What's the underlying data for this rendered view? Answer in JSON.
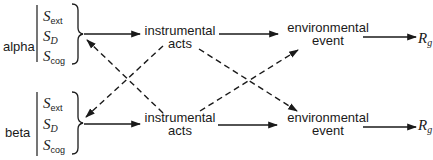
{
  "groups": [
    {
      "label": "alpha",
      "stimuli": [
        {
          "symbol": "S",
          "subscript": "ext",
          "subscript_italic": false
        },
        {
          "symbol": "S",
          "subscript": "D",
          "subscript_italic": true
        },
        {
          "symbol": "S",
          "subscript": "cog",
          "subscript_italic": false
        }
      ],
      "act": [
        "instrumental",
        "acts"
      ],
      "event": [
        "environmental",
        "event"
      ],
      "response": {
        "symbol": "R",
        "subscript": "g"
      }
    },
    {
      "label": "beta",
      "stimuli": [
        {
          "symbol": "S",
          "subscript": "ext",
          "subscript_italic": false
        },
        {
          "symbol": "S",
          "subscript": "D",
          "subscript_italic": true
        },
        {
          "symbol": "S",
          "subscript": "cog",
          "subscript_italic": false
        }
      ],
      "act": [
        "instrumental",
        "acts"
      ],
      "event": [
        "environmental",
        "event"
      ],
      "response": {
        "symbol": "R",
        "subscript": "g"
      }
    }
  ],
  "edges": [
    {
      "from": "alpha-stimuli",
      "to": "alpha-act",
      "style": "solid"
    },
    {
      "from": "alpha-act",
      "to": "alpha-event",
      "style": "solid"
    },
    {
      "from": "alpha-event",
      "to": "alpha-response",
      "style": "solid"
    },
    {
      "from": "beta-stimuli",
      "to": "beta-act",
      "style": "solid"
    },
    {
      "from": "beta-act",
      "to": "beta-event",
      "style": "solid"
    },
    {
      "from": "beta-event",
      "to": "beta-response",
      "style": "solid"
    },
    {
      "from": "alpha-act",
      "to": "beta-stimuli",
      "style": "dashed"
    },
    {
      "from": "beta-act",
      "to": "alpha-stimuli",
      "style": "dashed"
    },
    {
      "from": "alpha-act",
      "to": "beta-event",
      "style": "dashed"
    },
    {
      "from": "beta-act",
      "to": "alpha-event",
      "style": "dashed"
    }
  ]
}
